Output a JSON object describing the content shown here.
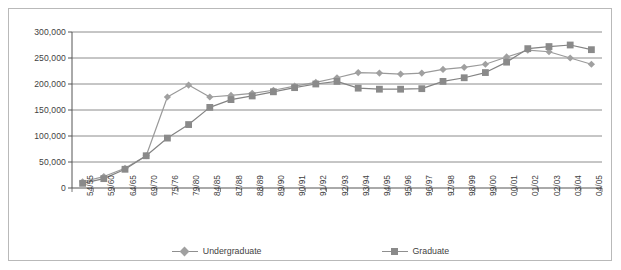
{
  "chart_data": {
    "type": "line",
    "title": "",
    "subtitle": "",
    "xlabel": "",
    "ylabel": "",
    "ylim": [
      0,
      300000
    ],
    "ytick_step": 50000,
    "grid": true,
    "legend_position": "bottom",
    "ytick_labels": [
      "0",
      "50,000",
      "100,000",
      "150,000",
      "200,000",
      "250,000",
      "300,000"
    ],
    "ytick_values": [
      0,
      50000,
      100000,
      150000,
      200000,
      250000,
      300000
    ],
    "categories": [
      "54/55",
      "59/60",
      "64/65",
      "69/70",
      "75/76",
      "79/80",
      "84/85",
      "87/88",
      "88/89",
      "89/90",
      "90/91",
      "91/92",
      "92/93",
      "93/94",
      "94/95",
      "95/96",
      "96/97",
      "97/98",
      "98/99",
      "99/00",
      "00/01",
      "01/02",
      "02/03",
      "03/04",
      "04/05"
    ],
    "series": [
      {
        "name": "Undergraduate",
        "marker": "diamond",
        "color": "#a0a0a0",
        "line_color": "#9a9a9a",
        "values": [
          12000,
          22000,
          38000,
          62000,
          175000,
          198000,
          175000,
          178000,
          182000,
          188000,
          196000,
          203000,
          212000,
          222000,
          221000,
          219000,
          221000,
          228000,
          232000,
          238000,
          252000,
          265000,
          262000,
          250000,
          238000
        ]
      },
      {
        "name": "Graduate",
        "marker": "square",
        "color": "#8a8a8a",
        "line_color": "#838383",
        "values": [
          9000,
          18000,
          36000,
          62000,
          96000,
          122000,
          155000,
          170000,
          177000,
          185000,
          193000,
          200000,
          205000,
          192000,
          190000,
          190000,
          191000,
          205000,
          212000,
          222000,
          242000,
          268000,
          272000,
          275000,
          266000
        ]
      }
    ],
    "colors": {
      "axis": "#555555",
      "grid": "#707070",
      "frame": "#b9b9b9",
      "text": "#3f3f3f",
      "undergraduate": "#a0a0a0",
      "graduate": "#8a8a8a"
    }
  },
  "legend": {
    "entries": [
      {
        "label": "Undergraduate",
        "marker": "diamond-marker-icon"
      },
      {
        "label": "Graduate",
        "marker": "square-marker-icon"
      }
    ]
  }
}
